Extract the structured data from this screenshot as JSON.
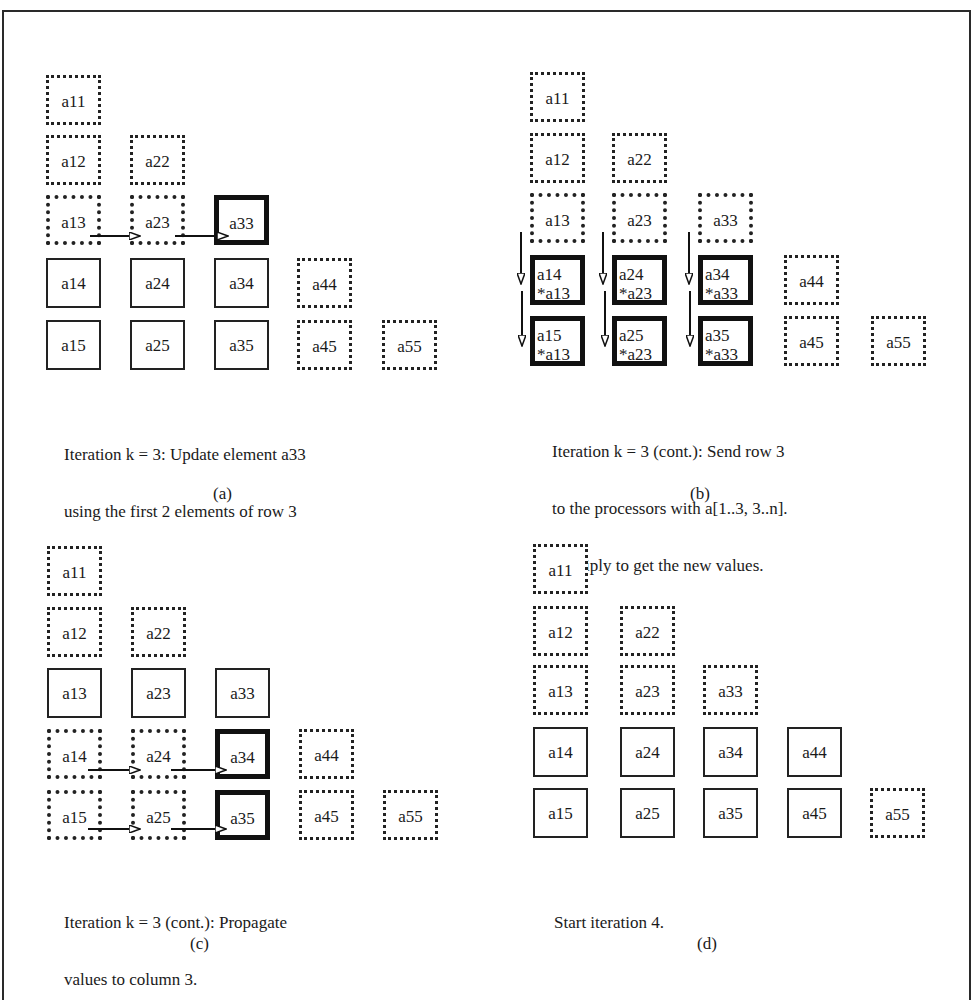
{
  "figure": {
    "panels": [
      {
        "id": "a",
        "label": "(a)",
        "caption_lines": [
          "Iteration k = 3: Update element a33",
          "using the first 2 elements of row 3"
        ],
        "cells": [
          {
            "name": "a11",
            "text": "a11",
            "style": "dotted",
            "col": 0,
            "row": 0
          },
          {
            "name": "a12",
            "text": "a12",
            "style": "dotted",
            "col": 0,
            "row": 1
          },
          {
            "name": "a22",
            "text": "a22",
            "style": "dotted",
            "col": 1,
            "row": 1
          },
          {
            "name": "a13",
            "text": "a13",
            "style": "dotted-heavy",
            "col": 0,
            "row": 2
          },
          {
            "name": "a23",
            "text": "a23",
            "style": "dotted-heavy",
            "col": 1,
            "row": 2
          },
          {
            "name": "a33",
            "text": "a33",
            "style": "bold",
            "col": 2,
            "row": 2
          },
          {
            "name": "a14",
            "text": "a14",
            "style": "solid",
            "col": 0,
            "row": 3
          },
          {
            "name": "a24",
            "text": "a24",
            "style": "solid",
            "col": 1,
            "row": 3
          },
          {
            "name": "a34",
            "text": "a34",
            "style": "solid",
            "col": 2,
            "row": 3
          },
          {
            "name": "a44",
            "text": "a44",
            "style": "dotted",
            "col": 3,
            "row": 3
          },
          {
            "name": "a15",
            "text": "a15",
            "style": "solid",
            "col": 0,
            "row": 4
          },
          {
            "name": "a25",
            "text": "a25",
            "style": "solid",
            "col": 1,
            "row": 4
          },
          {
            "name": "a35",
            "text": "a35",
            "style": "solid",
            "col": 2,
            "row": 4
          },
          {
            "name": "a45",
            "text": "a45",
            "style": "dotted",
            "col": 3,
            "row": 4
          },
          {
            "name": "a55",
            "text": "a55",
            "style": "dotted",
            "col": 4,
            "row": 4
          }
        ],
        "arrows": "horizontal-row-3"
      },
      {
        "id": "b",
        "label": "(b)",
        "caption_lines": [
          "Iteration k = 3 (cont.): Send row 3",
          "to the processors with a[1..3, 3..n].",
          "Multiply to get the new values."
        ],
        "cells": [
          {
            "name": "a11",
            "text": "a11",
            "style": "dotted",
            "col": 0,
            "row": 0
          },
          {
            "name": "a12",
            "text": "a12",
            "style": "dotted",
            "col": 0,
            "row": 1
          },
          {
            "name": "a22",
            "text": "a22",
            "style": "dotted",
            "col": 1,
            "row": 1
          },
          {
            "name": "a13",
            "text": "a13",
            "style": "dotted-heavy",
            "col": 0,
            "row": 2
          },
          {
            "name": "a23",
            "text": "a23",
            "style": "dotted-heavy",
            "col": 1,
            "row": 2
          },
          {
            "name": "a33",
            "text": "a33",
            "style": "dotted-heavy",
            "col": 2,
            "row": 2
          },
          {
            "name": "a14",
            "text": "a14\n*a13",
            "style": "bold",
            "col": 0,
            "row": 3,
            "two": true
          },
          {
            "name": "a24",
            "text": "a24\n*a23",
            "style": "bold",
            "col": 1,
            "row": 3,
            "two": true
          },
          {
            "name": "a34",
            "text": "a34\n*a33",
            "style": "bold",
            "col": 2,
            "row": 3,
            "two": true
          },
          {
            "name": "a44",
            "text": "a44",
            "style": "dotted",
            "col": 3,
            "row": 3
          },
          {
            "name": "a15",
            "text": "a15\n*a13",
            "style": "bold",
            "col": 0,
            "row": 4,
            "two": true
          },
          {
            "name": "a25",
            "text": "a25\n*a23",
            "style": "bold",
            "col": 1,
            "row": 4,
            "two": true
          },
          {
            "name": "a35",
            "text": "a35\n*a33",
            "style": "bold",
            "col": 2,
            "row": 4,
            "two": true
          },
          {
            "name": "a45",
            "text": "a45",
            "style": "dotted",
            "col": 3,
            "row": 4
          },
          {
            "name": "a55",
            "text": "a55",
            "style": "dotted",
            "col": 4,
            "row": 4
          }
        ],
        "arrows": "vertical-cols-1-3"
      },
      {
        "id": "c",
        "label": "(c)",
        "caption_lines": [
          "Iteration k = 3 (cont.): Propagate",
          "values to column 3."
        ],
        "cells": [
          {
            "name": "a11",
            "text": "a11",
            "style": "dotted",
            "col": 0,
            "row": 0
          },
          {
            "name": "a12",
            "text": "a12",
            "style": "dotted",
            "col": 0,
            "row": 1
          },
          {
            "name": "a22",
            "text": "a22",
            "style": "dotted",
            "col": 1,
            "row": 1
          },
          {
            "name": "a13",
            "text": "a13",
            "style": "solid",
            "col": 0,
            "row": 2
          },
          {
            "name": "a23",
            "text": "a23",
            "style": "solid",
            "col": 1,
            "row": 2
          },
          {
            "name": "a33",
            "text": "a33",
            "style": "solid",
            "col": 2,
            "row": 2
          },
          {
            "name": "a14",
            "text": "a14",
            "style": "dotted-heavy",
            "col": 0,
            "row": 3
          },
          {
            "name": "a24",
            "text": "a24",
            "style": "dotted-heavy",
            "col": 1,
            "row": 3
          },
          {
            "name": "a34",
            "text": "a34",
            "style": "bold",
            "col": 2,
            "row": 3
          },
          {
            "name": "a44",
            "text": "a44",
            "style": "dotted",
            "col": 3,
            "row": 3
          },
          {
            "name": "a15",
            "text": "a15",
            "style": "dotted-heavy",
            "col": 0,
            "row": 4
          },
          {
            "name": "a25",
            "text": "a25",
            "style": "dotted-heavy",
            "col": 1,
            "row": 4
          },
          {
            "name": "a35",
            "text": "a35",
            "style": "bold",
            "col": 2,
            "row": 4
          },
          {
            "name": "a45",
            "text": "a45",
            "style": "dotted",
            "col": 3,
            "row": 4
          },
          {
            "name": "a55",
            "text": "a55",
            "style": "dotted",
            "col": 4,
            "row": 4
          }
        ],
        "arrows": "horizontal-rows-4-5"
      },
      {
        "id": "d",
        "label": "(d)",
        "caption_lines": [
          "Start iteration 4."
        ],
        "cells": [
          {
            "name": "a11",
            "text": "a11",
            "style": "dotted",
            "col": 0,
            "row": 0
          },
          {
            "name": "a12",
            "text": "a12",
            "style": "dotted",
            "col": 0,
            "row": 1
          },
          {
            "name": "a22",
            "text": "a22",
            "style": "dotted",
            "col": 1,
            "row": 1
          },
          {
            "name": "a13",
            "text": "a13",
            "style": "dotted",
            "col": 0,
            "row": 2
          },
          {
            "name": "a23",
            "text": "a23",
            "style": "dotted",
            "col": 1,
            "row": 2
          },
          {
            "name": "a33",
            "text": "a33",
            "style": "dotted",
            "col": 2,
            "row": 2
          },
          {
            "name": "a14",
            "text": "a14",
            "style": "solid",
            "col": 0,
            "row": 3
          },
          {
            "name": "a24",
            "text": "a24",
            "style": "solid",
            "col": 1,
            "row": 3
          },
          {
            "name": "a34",
            "text": "a34",
            "style": "solid",
            "col": 2,
            "row": 3
          },
          {
            "name": "a44",
            "text": "a44",
            "style": "solid",
            "col": 3,
            "row": 3
          },
          {
            "name": "a15",
            "text": "a15",
            "style": "solid",
            "col": 0,
            "row": 4
          },
          {
            "name": "a25",
            "text": "a25",
            "style": "solid",
            "col": 1,
            "row": 4
          },
          {
            "name": "a35",
            "text": "a35",
            "style": "solid",
            "col": 2,
            "row": 4
          },
          {
            "name": "a45",
            "text": "a45",
            "style": "solid",
            "col": 3,
            "row": 4
          },
          {
            "name": "a55",
            "text": "a55",
            "style": "dotted",
            "col": 4,
            "row": 4
          }
        ],
        "arrows": "none"
      }
    ]
  }
}
